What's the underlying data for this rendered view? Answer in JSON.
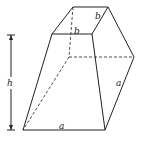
{
  "figure": {
    "type": "frustum-diagram",
    "labels": {
      "top_front_edge": "b",
      "top_side_edge": "b",
      "bottom_front_edge": "a",
      "bottom_side_edge": "a",
      "height": "h"
    }
  }
}
